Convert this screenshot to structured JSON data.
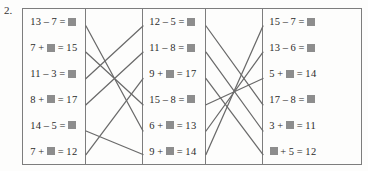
{
  "exercise": {
    "number": "2."
  },
  "colors": {
    "frame_border": "#7d7d7d",
    "line_stroke": "#6a6a6a",
    "answer_box_fill": "#8d8d8d",
    "text": "#2b2b2b",
    "page_background": "#fdfdfc"
  },
  "columns": {
    "left": {
      "name": "left-equation-column",
      "rows": [
        {
          "id": "L1",
          "text": "13 – 7 = ■",
          "parts": [
            "13",
            "–",
            "7",
            "=",
            "BOX"
          ]
        },
        {
          "id": "L2",
          "text": "7 + ■ = 15",
          "parts": [
            "7",
            "+",
            "BOX",
            "=",
            "15"
          ]
        },
        {
          "id": "L3",
          "text": "11 – 3 = ■",
          "parts": [
            "11",
            "–",
            "3",
            "=",
            "BOX"
          ]
        },
        {
          "id": "L4",
          "text": "8 + ■ = 17",
          "parts": [
            "8",
            "+",
            "BOX",
            "=",
            "17"
          ]
        },
        {
          "id": "L5",
          "text": "14 – 5 = ■",
          "parts": [
            "14",
            "–",
            "5",
            "=",
            "BOX"
          ]
        },
        {
          "id": "L6",
          "text": "7 + ■ = 12",
          "parts": [
            "7",
            "+",
            "BOX",
            "=",
            "12"
          ]
        }
      ]
    },
    "middle": {
      "name": "middle-equation-column",
      "rows": [
        {
          "id": "M1",
          "text": "12 – 5 = ■",
          "parts": [
            "12",
            "–",
            "5",
            "=",
            "BOX"
          ]
        },
        {
          "id": "M2",
          "text": "11 – 8 = ■",
          "parts": [
            "11",
            "–",
            "8",
            "=",
            "BOX"
          ]
        },
        {
          "id": "M3",
          "text": "9 + ■ = 17",
          "parts": [
            "9",
            "+",
            "BOX",
            "=",
            "17"
          ]
        },
        {
          "id": "M4",
          "text": "15 – 8 = ■",
          "parts": [
            "15",
            "–",
            "8",
            "=",
            "BOX"
          ]
        },
        {
          "id": "M5",
          "text": "6 + ■ = 13",
          "parts": [
            "6",
            "+",
            "BOX",
            "=",
            "13"
          ]
        },
        {
          "id": "M6",
          "text": "9 + ■ = 14",
          "parts": [
            "9",
            "+",
            "BOX",
            "=",
            "14"
          ]
        }
      ]
    },
    "right": {
      "name": "right-equation-column",
      "rows": [
        {
          "id": "R1",
          "text": "15 – 7 = ■",
          "parts": [
            "15",
            "–",
            "7",
            "=",
            "BOX"
          ]
        },
        {
          "id": "R2",
          "text": "13 – 6 = ■",
          "parts": [
            "13",
            "–",
            "6",
            "=",
            "BOX"
          ]
        },
        {
          "id": "R3",
          "text": "5 + ■ = 14",
          "parts": [
            "5",
            "+",
            "BOX",
            "=",
            "14"
          ]
        },
        {
          "id": "R4",
          "text": "17 – 8 = ■",
          "parts": [
            "17",
            "–",
            "8",
            "=",
            "BOX"
          ]
        },
        {
          "id": "R5",
          "text": "3 + ■ = 11",
          "parts": [
            "3",
            "+",
            "BOX",
            "=",
            "11"
          ]
        },
        {
          "id": "R6",
          "text": "■ + 5 = 12",
          "parts": [
            "BOX",
            "+",
            "5",
            "=",
            "12"
          ]
        }
      ]
    }
  },
  "connections": {
    "left_gap": [
      {
        "from": "L1",
        "to": "M5"
      },
      {
        "from": "L2",
        "to": "M4"
      },
      {
        "from": "L3",
        "to": "M1"
      },
      {
        "from": "L4",
        "to": "M2"
      },
      {
        "from": "L5",
        "to": "M6"
      },
      {
        "from": "L6",
        "to": "M3"
      }
    ],
    "right_gap": [
      {
        "from": "M1",
        "to": "R4"
      },
      {
        "from": "M2",
        "to": "R5"
      },
      {
        "from": "M3",
        "to": "R6"
      },
      {
        "from": "M4",
        "to": "R3"
      },
      {
        "from": "M5",
        "to": "R2"
      },
      {
        "from": "M6",
        "to": "R1"
      }
    ]
  },
  "geometry": {
    "row_y": [
      17.0,
      43.2,
      69.5,
      95.8,
      122.0,
      145.5
    ],
    "gap1_x": [
      63,
      120
    ],
    "gap2_x": [
      183,
      240
    ],
    "col_right_x": 240
  }
}
